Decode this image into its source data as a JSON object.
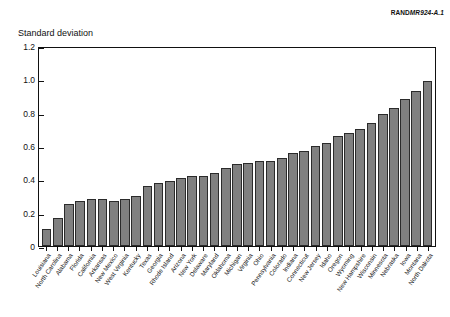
{
  "credit": {
    "brand": "RAND",
    "code": "MR924-A.1"
  },
  "axis": {
    "y_title": "Standard deviation",
    "ticks": [
      "0",
      "0.2",
      "0.4",
      "0.6",
      "0.8",
      "1.0",
      "1.2"
    ]
  },
  "chart_data": {
    "type": "bar",
    "title": "",
    "subtitle": "",
    "xlabel": "",
    "ylabel": "Standard deviation",
    "ylim": [
      0,
      1.2
    ],
    "ytick_values": [
      0,
      0.2,
      0.4,
      0.6,
      0.8,
      1.0,
      1.2
    ],
    "grid": false,
    "legend": null,
    "bar_color": "#808080",
    "bar_edge_color": "#2b2b2b",
    "categories": [
      "Louisiana",
      "North Carolina",
      "Alabama",
      "Florida",
      "California",
      "Arkansas",
      "New Mexico",
      "West Virginia",
      "Kentucky",
      "Texas",
      "Georgia",
      "Rhode Island",
      "Arizona",
      "New York",
      "Delaware",
      "Maryland",
      "Oklahoma",
      "Michigan",
      "Virginia",
      "Ohio",
      "Pennsylvania",
      "Colorado",
      "Indiana",
      "Connecticut",
      "New Jersey",
      "Idaho",
      "Oregon",
      "Wyoming",
      "New Hampshire",
      "Wisconsin",
      "Minnesota",
      "Nebraska",
      "Iowa",
      "Montana",
      "North Dakota"
    ],
    "values": [
      0.1,
      0.17,
      0.25,
      0.27,
      0.28,
      0.28,
      0.27,
      0.28,
      0.3,
      0.36,
      0.38,
      0.39,
      0.41,
      0.42,
      0.42,
      0.44,
      0.47,
      0.49,
      0.5,
      0.51,
      0.51,
      0.53,
      0.56,
      0.57,
      0.6,
      0.62,
      0.66,
      0.68,
      0.7,
      0.74,
      0.79,
      0.83,
      0.88,
      0.93,
      0.99
    ]
  }
}
